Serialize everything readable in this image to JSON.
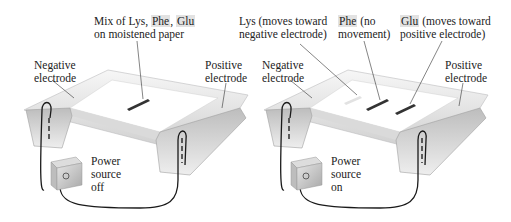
{
  "panels": [
    {
      "name": "before",
      "top_label": {
        "line1_prefix": "Mix of ",
        "lys": "Lys",
        "sep1": ", ",
        "phe": "Phe",
        "sep2": ", ",
        "glu": "Glu",
        "line2": "on moistened paper"
      },
      "negative_label": [
        "Negative",
        "electrode"
      ],
      "positive_label": [
        "Positive",
        "electrode"
      ],
      "power_label": [
        "Power",
        "source",
        "off"
      ]
    },
    {
      "name": "after",
      "lys_label": {
        "name": "Lys",
        "line1": " (moves toward",
        "line2": "negative electrode)"
      },
      "phe_label": {
        "name": "Phe",
        "line1": " (no",
        "line2": "movement)"
      },
      "glu_label": {
        "name": "Glu",
        "line1": " (moves toward",
        "line2": "positive electrode)"
      },
      "negative_label": [
        "Negative",
        "electrode"
      ],
      "positive_label": [
        "Positive",
        "electrode"
      ],
      "power_label": [
        "Power",
        "source",
        "on"
      ]
    }
  ],
  "colors": {
    "tray_light": "#f4f4f4",
    "tray_mid": "#d9d9d9",
    "tray_dark": "#a9a9a9",
    "band": "#3a3a3a",
    "wire": "#1a1a1a",
    "highlight": "#e2e2e2"
  }
}
